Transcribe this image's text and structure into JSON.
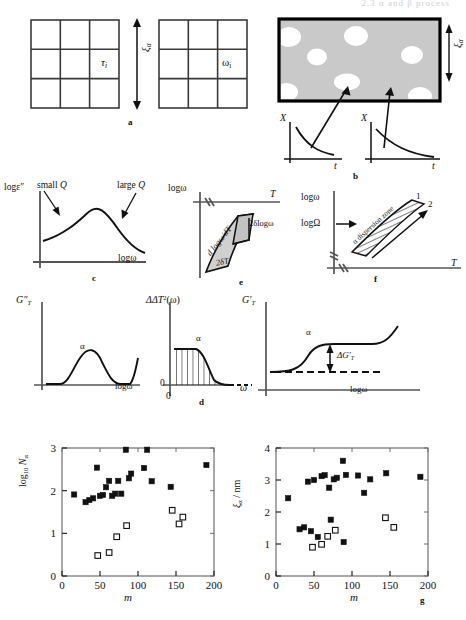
{
  "figure": {
    "header_faint": "2.3  α and β process",
    "panel_letters": {
      "a": "a",
      "b": "b",
      "c": "c",
      "d": "d",
      "e": "e",
      "f": "f",
      "g": "g"
    }
  },
  "panel_a": {
    "grid_left_label": "τ",
    "grid_left_sub": "i",
    "grid_right_label": "ω",
    "grid_right_sub": "i",
    "arrow_label": "ξ",
    "arrow_sub": "α",
    "rows": 3,
    "cols": 3
  },
  "panel_b": {
    "size_label": "ξ",
    "size_sub": "α",
    "plot1": {
      "ylabel": "X",
      "xlabel": "t"
    },
    "plot2": {
      "ylabel": "X",
      "xlabel": "t"
    },
    "blob_count": 7
  },
  "panel_c": {
    "ylabel": "logε″",
    "xlabel": "logω",
    "annotation_left": "small Q",
    "annotation_right": "large Q"
  },
  "panel_d": {
    "left": {
      "ylabel": "G″",
      "ylabel_sub": "T",
      "xlabel": "logω",
      "peak_label": "α"
    },
    "mid": {
      "ylabel": "ΔT",
      "ylabel_sup": "2",
      "ylabel_arg": "(ω)",
      "xlabel": "ω",
      "origin": "0",
      "peak_label": "α"
    },
    "right": {
      "ylabel": "G′",
      "ylabel_sub": "T",
      "xlabel": "logω",
      "step_label": "α",
      "delta_label": "ΔG′",
      "delta_sub": "T"
    }
  },
  "panel_e": {
    "ylabel": "logω",
    "xlabel": "T",
    "slope_label": "d logω/dT",
    "vert_label": "2δlogω",
    "horiz_label": "2δT"
  },
  "panel_f": {
    "ylabel": "logω",
    "ylabel2": "logΩ",
    "xlabel": "T",
    "zone_label": "α dispersion zone",
    "curve1": "1",
    "curve2": "2"
  },
  "chart_data": [
    {
      "type": "scatter",
      "title": "",
      "xlabel": "m",
      "ylabel": "log₁₀ Nα",
      "ylabel_parts": {
        "base": "log",
        "sub": "10",
        "var": "N",
        "varsub": "α"
      },
      "xlim": [
        0,
        200
      ],
      "ylim": [
        0,
        3
      ],
      "xticks": [
        0,
        50,
        100,
        150,
        200
      ],
      "yticks": [
        0,
        1,
        2,
        3
      ],
      "grid": false,
      "legend": "none",
      "series": [
        {
          "name": "filled-squares",
          "marker": "filled-square",
          "points": [
            [
              16,
              1.91
            ],
            [
              31,
              1.73
            ],
            [
              36,
              1.78
            ],
            [
              41,
              1.82
            ],
            [
              46,
              2.54
            ],
            [
              50,
              1.88
            ],
            [
              54,
              1.9
            ],
            [
              58,
              2.08
            ],
            [
              62,
              2.23
            ],
            [
              66,
              1.88
            ],
            [
              70,
              1.93
            ],
            [
              74,
              2.23
            ],
            [
              78,
              1.93
            ],
            [
              84,
              2.96
            ],
            [
              88,
              2.29
            ],
            [
              91,
              2.4
            ],
            [
              108,
              2.53
            ],
            [
              112,
              2.96
            ],
            [
              118,
              2.22
            ],
            [
              143,
              2.09
            ],
            [
              190,
              2.6
            ]
          ]
        },
        {
          "name": "open-squares",
          "marker": "open-square",
          "points": [
            [
              47,
              0.48
            ],
            [
              62,
              0.55
            ],
            [
              72,
              0.92
            ],
            [
              85,
              1.18
            ],
            [
              145,
              1.54
            ],
            [
              154,
              1.22
            ],
            [
              159,
              1.38
            ]
          ]
        }
      ]
    },
    {
      "type": "scatter",
      "title": "",
      "xlabel": "m",
      "ylabel": "ξα / nm",
      "ylabel_parts": {
        "var": "ξ",
        "varsub": "α",
        "unit": "/ nm"
      },
      "xlim": [
        0,
        200
      ],
      "ylim": [
        0,
        4
      ],
      "xticks": [
        0,
        50,
        100,
        150,
        200
      ],
      "yticks": [
        0,
        1,
        2,
        3,
        4
      ],
      "grid": false,
      "legend": "none",
      "series": [
        {
          "name": "filled-squares",
          "marker": "filled-square",
          "points": [
            [
              16,
              2.43
            ],
            [
              31,
              1.46
            ],
            [
              37,
              1.52
            ],
            [
              42,
              2.95
            ],
            [
              46,
              1.4
            ],
            [
              50,
              3.0
            ],
            [
              55,
              1.22
            ],
            [
              60,
              3.12
            ],
            [
              64,
              3.15
            ],
            [
              70,
              2.76
            ],
            [
              72,
              1.76
            ],
            [
              76,
              3.02
            ],
            [
              80,
              3.07
            ],
            [
              88,
              3.6
            ],
            [
              89,
              1.06
            ],
            [
              92,
              3.16
            ],
            [
              108,
              3.14
            ],
            [
              116,
              2.6
            ],
            [
              124,
              3.02
            ],
            [
              145,
              3.21
            ],
            [
              190,
              3.1
            ]
          ]
        },
        {
          "name": "open-squares",
          "marker": "open-square",
          "points": [
            [
              48,
              0.9
            ],
            [
              60,
              0.99
            ],
            [
              68,
              1.24
            ],
            [
              78,
              1.43
            ],
            [
              144,
              1.82
            ],
            [
              155,
              1.52
            ]
          ]
        }
      ]
    }
  ]
}
